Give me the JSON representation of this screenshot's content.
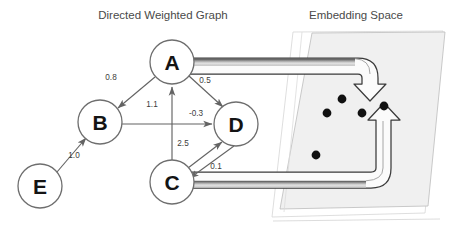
{
  "titles": {
    "left": "Directed Weighted Graph",
    "right": "Embedding Space"
  },
  "colors": {
    "background": "#ffffff",
    "title_text": "#4a4a4a",
    "node_stroke": "#6e6e6e",
    "node_fill": "#ffffff",
    "node_label": "#141414",
    "edge_stroke": "#636363",
    "weight_text": "#3d3d3d",
    "plane_fill": "#f0f0f0",
    "plane_stroke": "#b8b8b8",
    "dot_fill": "#111111",
    "ribbon_outline": "#3a3a3a",
    "ribbon_fill_light": "#f5f5f5",
    "ribbon_fill_dark": "#8d8d8d"
  },
  "graph": {
    "nodes": [
      {
        "id": "A",
        "label": "A",
        "cx": 172,
        "cy": 62,
        "r": 22
      },
      {
        "id": "B",
        "label": "B",
        "cx": 100,
        "cy": 122,
        "r": 22
      },
      {
        "id": "C",
        "label": "C",
        "cx": 172,
        "cy": 182,
        "r": 22
      },
      {
        "id": "D",
        "label": "D",
        "cx": 236,
        "cy": 124,
        "r": 22
      },
      {
        "id": "E",
        "label": "E",
        "cx": 40,
        "cy": 186,
        "r": 22
      }
    ],
    "edges": [
      {
        "from": "A",
        "to": "B",
        "weight": "0.8",
        "lx": 111,
        "ly": 80
      },
      {
        "from": "C",
        "to": "A",
        "weight": "1.1",
        "lx": 152,
        "ly": 107
      },
      {
        "from": "A",
        "to": "D",
        "weight": "0.5",
        "lx": 205,
        "ly": 83
      },
      {
        "from": "B",
        "to": "D",
        "weight": "-0.3",
        "lx": 196,
        "ly": 116
      },
      {
        "from": "C",
        "to": "D",
        "weight": "2.5",
        "lx": 183,
        "ly": 146
      },
      {
        "from": "D",
        "to": "C",
        "weight": "0.1",
        "lx": 216,
        "ly": 169
      },
      {
        "from": "E",
        "to": "B",
        "weight": "1.0",
        "lx": 74,
        "ly": 158
      }
    ]
  },
  "embedding": {
    "points": [
      {
        "x": 342,
        "y": 99
      },
      {
        "x": 327,
        "y": 113
      },
      {
        "x": 362,
        "y": 113
      },
      {
        "x": 384,
        "y": 106
      },
      {
        "x": 316,
        "y": 155
      }
    ],
    "mappings": [
      {
        "source": "A",
        "target_point_index": 0,
        "direction": "down"
      },
      {
        "source": "C",
        "target_point_index": 3,
        "direction": "up"
      }
    ]
  }
}
